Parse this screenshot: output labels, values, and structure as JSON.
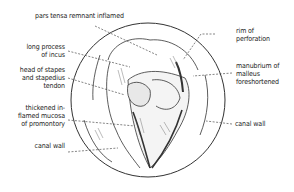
{
  "diagram": {
    "labels": {
      "pars_tensa": "pars tensa remnant inflamed",
      "long_process": "long process\nof incus",
      "head_stapes": "head of stapes\nand stapedius\ntendon",
      "thickened_mucosa": "thickened in-\nflamed mucosa\nof promontory",
      "canal_wall_left": "canal wall",
      "rim": "rim of\nperforation",
      "manubrium": "manubrium of\nmalleus\nforeshortened",
      "canal_wall_right": "canal wall"
    },
    "colors": {
      "ink": "#222222",
      "background": "#ffffff"
    }
  }
}
